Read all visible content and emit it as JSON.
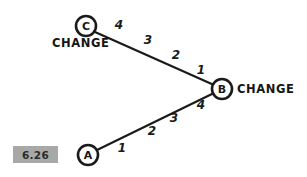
{
  "figure": {
    "tag": "6.26",
    "tag_box_color": "#a8a8a8",
    "background": "#ffffff",
    "ink_color": "#1a1a1a"
  },
  "diagram": {
    "type": "node-link-graph",
    "nodes": [
      {
        "id": "C",
        "letter": "C",
        "label": "CHANGE",
        "cx": 86,
        "cy": 26,
        "r": 10,
        "label_x": 52,
        "label_y": 47
      },
      {
        "id": "B",
        "letter": "B",
        "label": "CHANGE",
        "cx": 222,
        "cy": 89,
        "r": 10,
        "label_x": 237,
        "label_y": 93
      },
      {
        "id": "A",
        "letter": "A",
        "label": "",
        "cx": 88,
        "cy": 155,
        "r": 10,
        "label_x": 0,
        "label_y": 0
      }
    ],
    "edges": [
      {
        "id": "edge-c-b",
        "from": "C",
        "to": "B",
        "x1": 95,
        "y1": 32,
        "x2": 214,
        "y2": 85,
        "weights": [
          {
            "value": "4",
            "x": 119,
            "y": 25
          },
          {
            "value": "3",
            "x": 148,
            "y": 40
          },
          {
            "value": "2",
            "x": 176,
            "y": 55
          },
          {
            "value": "1",
            "x": 201,
            "y": 70
          }
        ]
      },
      {
        "id": "edge-a-b",
        "from": "A",
        "to": "B",
        "x1": 97,
        "y1": 150,
        "x2": 214,
        "y2": 93,
        "weights": [
          {
            "value": "1",
            "x": 122,
            "y": 148
          },
          {
            "value": "2",
            "x": 152,
            "y": 131
          },
          {
            "value": "3",
            "x": 174,
            "y": 118
          },
          {
            "value": "4",
            "x": 201,
            "y": 105
          }
        ]
      }
    ]
  }
}
